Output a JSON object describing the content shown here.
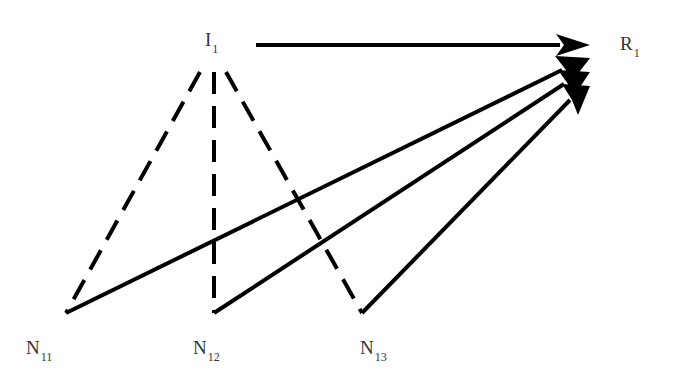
{
  "diagram": {
    "nodes": [
      {
        "id": "I1",
        "main": "I",
        "sub": "1",
        "x": 205,
        "y": 30
      },
      {
        "id": "R1",
        "main": "R",
        "sub": "1",
        "x": 620,
        "y": 34
      },
      {
        "id": "N11",
        "main": "N",
        "sub": "11",
        "x": 26,
        "y": 338
      },
      {
        "id": "N12",
        "main": "N",
        "sub": "12",
        "x": 193,
        "y": 338
      },
      {
        "id": "N13",
        "main": "N",
        "sub": "13",
        "x": 360,
        "y": 338
      }
    ],
    "edges": [
      {
        "from": "I1",
        "to": "R1",
        "style": "solid-arrow"
      },
      {
        "from": "I1",
        "to": "N11",
        "style": "dashed"
      },
      {
        "from": "I1",
        "to": "N12",
        "style": "dashed"
      },
      {
        "from": "I1",
        "to": "N13",
        "style": "dashed"
      },
      {
        "from": "N11",
        "to": "R1",
        "style": "solid-arrow"
      },
      {
        "from": "N12",
        "to": "R1",
        "style": "solid-arrow"
      },
      {
        "from": "N13",
        "to": "R1",
        "style": "solid-arrow"
      }
    ]
  }
}
